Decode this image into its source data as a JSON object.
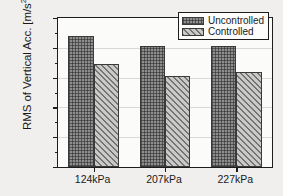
{
  "chart_data": {
    "type": "bar",
    "title": "",
    "xlabel": "",
    "ylabel": "RMS of Vertical Acc. [m/s",
    "ylabel_exponent": "2",
    "ylabel_suffix": "]",
    "categories": [
      "124kPa",
      "207kPa",
      "227kPa"
    ],
    "series": [
      {
        "name": "Uncontrolled",
        "values": [
          0.088,
          0.081,
          0.081
        ],
        "fill": "crosshatch",
        "color": "#8d8d8d"
      },
      {
        "name": "Controlled",
        "values": [
          0.069,
          0.061,
          0.064
        ],
        "fill": "diagonal-hatch",
        "color": "#c9c9c7"
      }
    ],
    "ylim": [
      0.0,
      0.1
    ],
    "ytick_labels": [
      "0.10",
      "0.08",
      "0.06",
      "0.04",
      "0.02",
      "0.00"
    ],
    "ytick_values": [
      0.1,
      0.08,
      0.06,
      0.04,
      0.02,
      0.0
    ],
    "yminor_values": [
      0.09,
      0.07,
      0.05,
      0.03,
      0.01
    ],
    "grid": true,
    "grid_orientation": "horizontal",
    "legend_position": "top-right"
  },
  "legend": {
    "entries": [
      {
        "label": "Uncontrolled"
      },
      {
        "label": "Controlled"
      }
    ]
  }
}
